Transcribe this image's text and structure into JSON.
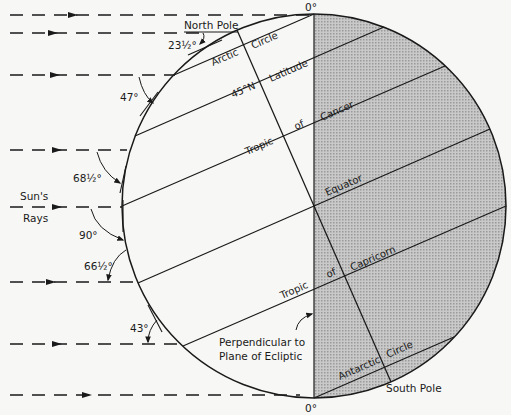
{
  "diagram": {
    "title_top_zero": "0°",
    "title_bottom_zero": "0°",
    "north_pole": "North Pole",
    "south_pole": "South Pole",
    "sun_rays_line1": "Sun's",
    "sun_rays_line2": "Rays",
    "perpendicular_line1": "Perpendicular to",
    "perpendicular_line2": "Plane of Ecliptic",
    "latitudes": {
      "arctic_1": "Arctic",
      "arctic_2": "Circle",
      "lat45_1": "45°N",
      "lat45_2": "Latitude",
      "cancer_1": "Tropic",
      "cancer_2": "of",
      "cancer_3": "Cancer",
      "equator": "Equator",
      "capricorn_1": "Tropic",
      "capricorn_2": "of",
      "capricorn_3": "Capricorn",
      "antarctic_1": "Antarctic",
      "antarctic_2": "Circle"
    },
    "angles": {
      "north_pole": "23½°",
      "arctic": "47°",
      "cancer": "68½°",
      "equator": "90°",
      "capricorn": "66½°",
      "lat_43": "43°"
    },
    "colors": {
      "ink": "#1a1a1a",
      "night_shade": "#b8b8b8",
      "paper": "#f7f7f5"
    },
    "axial_tilt_deg": 23.5
  }
}
